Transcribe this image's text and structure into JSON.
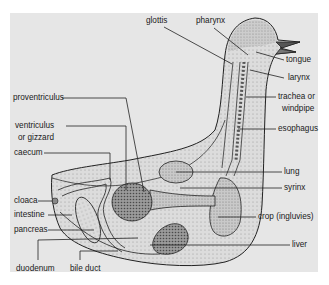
{
  "diagram": {
    "background_color": "#e6e6e6",
    "labels": {
      "glottis": "glottis",
      "pharynx": "pharynx",
      "tongue": "tongue",
      "larynx": "larynx",
      "trachea_1": "trachea or",
      "trachea_2": "windpipe",
      "esophagus": "esophagus",
      "proventriculus": "proventriculus",
      "ventriculus_1": "ventriculus",
      "ventriculus_2": "or gizzard",
      "caecum": "caecum",
      "lung": "lung",
      "syrinx": "syrinx",
      "cloaca": "cloaca",
      "intestine": "intestine",
      "crop": "crop (ingluvies)",
      "pancreas": "pancreas",
      "liver": "liver",
      "duodenum": "duodenum",
      "bile_duct": "bile duct"
    }
  }
}
